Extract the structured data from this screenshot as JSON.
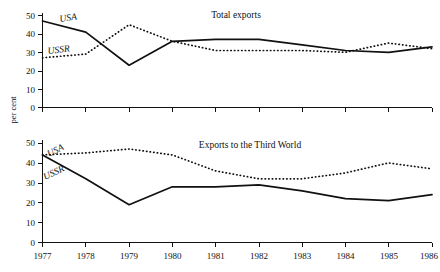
{
  "figure": {
    "y_axis_title": "per cent",
    "x_tick_labels": [
      "1977",
      "1978",
      "1979",
      "1980",
      "1981",
      "1982",
      "1983",
      "1984",
      "1985",
      "1986"
    ],
    "y_tick_labels": [
      "0",
      "10",
      "20",
      "30",
      "40",
      "50"
    ],
    "series_label_usa": "USA",
    "series_label_ussr": "USSR"
  },
  "chart_data": [
    {
      "type": "line",
      "panel": "top",
      "title": "Total exports",
      "xlabel": "",
      "ylabel": "per cent",
      "x": [
        1977,
        1978,
        1979,
        1980,
        1981,
        1982,
        1983,
        1984,
        1985,
        1986
      ],
      "xlim": [
        1977,
        1986
      ],
      "ylim": [
        0,
        50
      ],
      "yticks": [
        0,
        10,
        20,
        30,
        40,
        50
      ],
      "grid": false,
      "legend": "inline-labels",
      "series": [
        {
          "name": "USA",
          "style": "solid",
          "values": [
            47,
            41,
            23,
            36,
            37,
            37,
            34,
            31,
            30,
            33
          ]
        },
        {
          "name": "USSR",
          "style": "dotted",
          "values": [
            27,
            29,
            45,
            36,
            31,
            31,
            31,
            30,
            35,
            32
          ]
        }
      ]
    },
    {
      "type": "line",
      "panel": "bottom",
      "title": "Exports to the Third World",
      "xlabel": "",
      "ylabel": "per cent",
      "x": [
        1977,
        1978,
        1979,
        1980,
        1981,
        1982,
        1983,
        1984,
        1985,
        1986
      ],
      "xlim": [
        1977,
        1986
      ],
      "ylim": [
        0,
        50
      ],
      "yticks": [
        0,
        10,
        20,
        30,
        40,
        50
      ],
      "grid": false,
      "legend": "inline-labels",
      "series": [
        {
          "name": "USA",
          "style": "dotted",
          "values": [
            44,
            45,
            47,
            44,
            36,
            32,
            32,
            35,
            40,
            37
          ]
        },
        {
          "name": "USSR",
          "style": "solid",
          "values": [
            44,
            32,
            19,
            28,
            28,
            29,
            26,
            22,
            21,
            24
          ]
        }
      ]
    }
  ]
}
